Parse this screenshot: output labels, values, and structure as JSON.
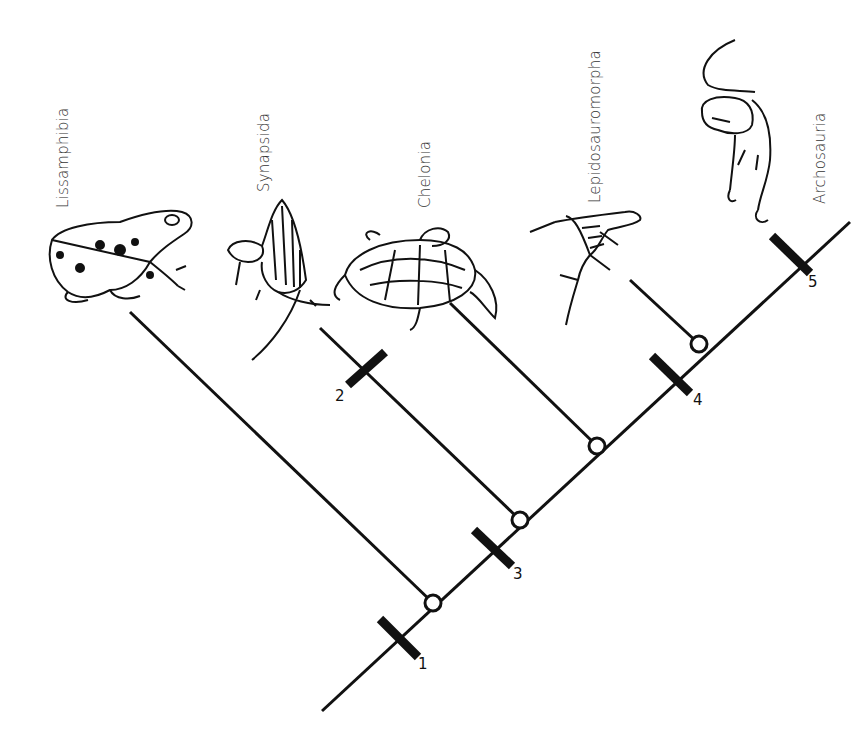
{
  "diagram": {
    "type": "cladogram",
    "line_color": "#111111",
    "background": "#ffffff",
    "taxa": [
      {
        "name": "Lissamphibia",
        "illustration": "frog-icon"
      },
      {
        "name": "Synapsida",
        "illustration": "dimetrodon-icon"
      },
      {
        "name": "Chelonia",
        "illustration": "turtle-icon"
      },
      {
        "name": "Lepidosauromorpha",
        "illustration": "lizard-icon"
      },
      {
        "name": "Archosauria",
        "illustration": "theropod-dinosaur-icon"
      }
    ],
    "synapomorphy_ticks": [
      {
        "label": "1",
        "position": "trunk base, below Lissamphibia node"
      },
      {
        "label": "2",
        "position": "Synapsida branch"
      },
      {
        "label": "3",
        "position": "trunk, between Lissamphibia and Synapsida nodes"
      },
      {
        "label": "4",
        "position": "trunk, below Lepidosauromorpha node"
      },
      {
        "label": "5",
        "position": "Archosauria terminal"
      }
    ],
    "nodes": 4,
    "node_style": "open-circle"
  }
}
